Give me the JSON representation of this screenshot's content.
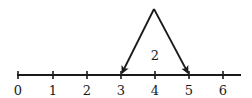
{
  "number_line": {
    "start": 0,
    "end": 6,
    "tick_labels": [
      "0",
      "1",
      "2",
      "3",
      "4",
      "5",
      "6"
    ],
    "color": "#1a1a1a"
  },
  "jump": {
    "from": 5,
    "to": 3,
    "label": "2",
    "description": "Arrows from apex above 4 pointing down to 3 and 5, with label 2"
  }
}
